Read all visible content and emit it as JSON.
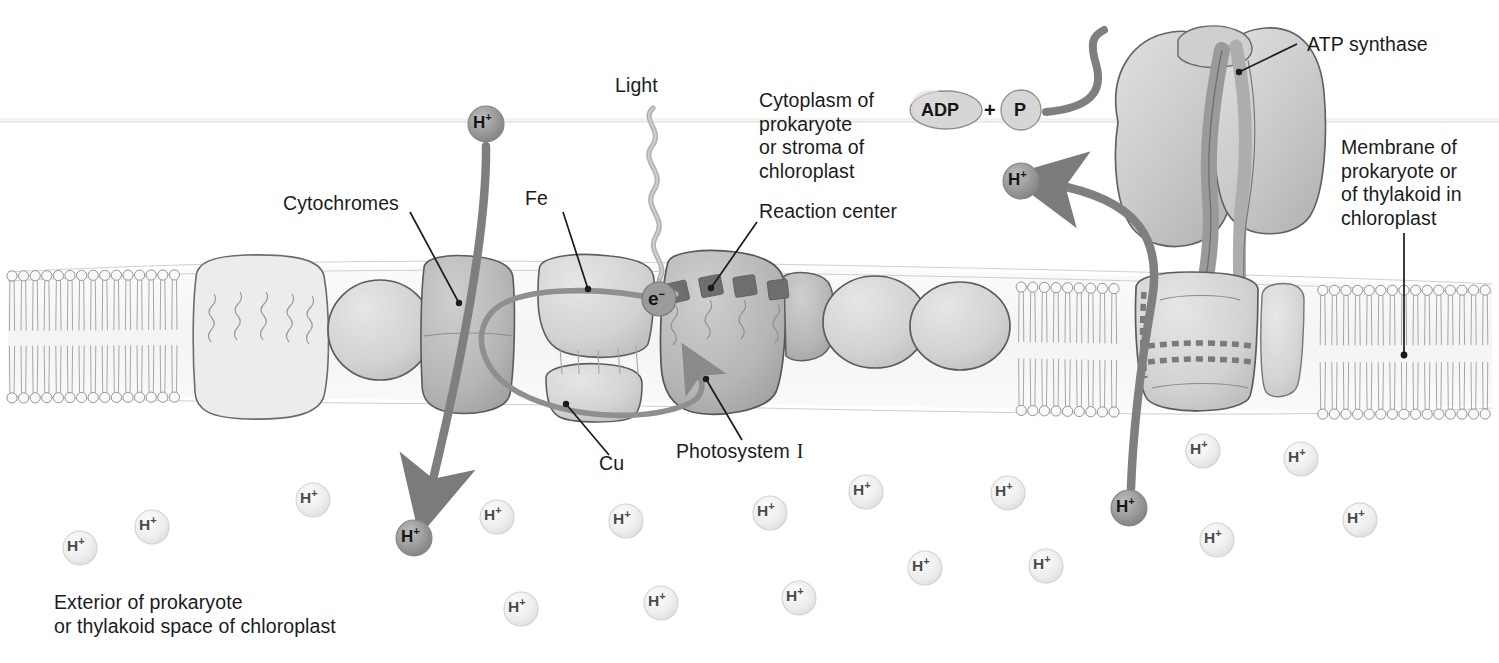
{
  "diagram": {
    "colors": {
      "ink": "#1b1b1b",
      "membrane_fill": "#f2f2f2",
      "membrane_line": "#5f5f5f",
      "protein_fill": "#d8d8d8",
      "protein_fill_dark": "#b9b9b9",
      "protein_line": "#6a6a6a",
      "arrow_gray": "#7b7b7b",
      "ion_dark": "#8f8f8f",
      "ion_light": "#e8e8e8",
      "chlorophyll": "#6e6e6e",
      "light_ray": "#b0b0b0"
    }
  },
  "labels": {
    "light": "Light",
    "cytoplasm": "Cytoplasm of\nprokaryote\nor stroma of\nchloroplast",
    "reaction_center": "Reaction center",
    "atp_synthase": "ATP synthase",
    "membrane": "Membrane of\nprokaryote or\nof thylakoid in\nchloroplast",
    "cytochromes": "Cytochromes",
    "fe": "Fe",
    "cu": "Cu",
    "photosystem_name": "Photosystem",
    "photosystem_numeral": "I",
    "exterior": "Exterior of prokaryote\nor thylakoid space of chloroplast"
  },
  "molecules": {
    "adp": "ADP",
    "plus": "+",
    "phosphate": "P",
    "electron": "e",
    "electron_charge": "−",
    "proton": "H",
    "proton_charge": "+"
  },
  "protons": {
    "transported": [
      {
        "id": "h-top-membrane",
        "x": 486,
        "y": 124,
        "r": 18,
        "state": "dark"
      },
      {
        "id": "h-bottom-left",
        "x": 414,
        "y": 538,
        "r": 18,
        "state": "dark"
      },
      {
        "id": "h-bottom-right",
        "x": 1129,
        "y": 508,
        "r": 18,
        "state": "dark"
      },
      {
        "id": "h-released-top",
        "x": 1021,
        "y": 181,
        "r": 18,
        "state": "dark"
      }
    ],
    "ambient": [
      {
        "id": "h-a1",
        "x": 80,
        "y": 548,
        "r": 17
      },
      {
        "id": "h-a2",
        "x": 152,
        "y": 527,
        "r": 17
      },
      {
        "id": "h-a3",
        "x": 313,
        "y": 500,
        "r": 17
      },
      {
        "id": "h-a4",
        "x": 497,
        "y": 517,
        "r": 17
      },
      {
        "id": "h-a5",
        "x": 521,
        "y": 609,
        "r": 17
      },
      {
        "id": "h-a6",
        "x": 626,
        "y": 521,
        "r": 17
      },
      {
        "id": "h-a7",
        "x": 661,
        "y": 603,
        "r": 17
      },
      {
        "id": "h-a8",
        "x": 770,
        "y": 513,
        "r": 17
      },
      {
        "id": "h-a9",
        "x": 799,
        "y": 598,
        "r": 17
      },
      {
        "id": "h-a10",
        "x": 866,
        "y": 492,
        "r": 17
      },
      {
        "id": "h-a11",
        "x": 925,
        "y": 568,
        "r": 17
      },
      {
        "id": "h-a12",
        "x": 1008,
        "y": 493,
        "r": 17
      },
      {
        "id": "h-a13",
        "x": 1046,
        "y": 566,
        "r": 17
      },
      {
        "id": "h-a14",
        "x": 1203,
        "y": 451,
        "r": 17
      },
      {
        "id": "h-a15",
        "x": 1217,
        "y": 540,
        "r": 17
      },
      {
        "id": "h-a16",
        "x": 1301,
        "y": 459,
        "r": 17
      },
      {
        "id": "h-a17",
        "x": 1360,
        "y": 520,
        "r": 17
      }
    ]
  },
  "structures": {
    "membrane_top_y": 272,
    "membrane_bottom_y": 410,
    "scan_line_y": 122,
    "complexes": [
      {
        "name": "light-harvesting-complex-left",
        "x": 200,
        "w": 130
      },
      {
        "name": "cytochrome-complex",
        "x": 425,
        "w": 95
      },
      {
        "name": "iron-sulfur-complex",
        "x": 540,
        "w": 110
      },
      {
        "name": "reaction-center-complex",
        "x": 665,
        "w": 120
      },
      {
        "name": "photosystem-one",
        "x": 690,
        "w": 110
      },
      {
        "name": "atp-synthase-base",
        "x": 1130,
        "w": 130
      }
    ]
  }
}
